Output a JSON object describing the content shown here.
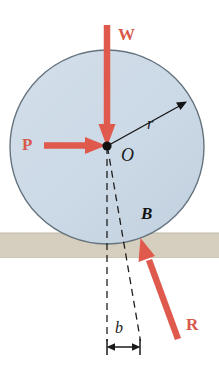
{
  "figure": {
    "canvas": {
      "width": 219,
      "height": 366
    },
    "colors": {
      "force_red": "#e0594d",
      "wheel_fill": "#ccd9e6",
      "wheel_stroke": "#5a6a76",
      "ground_fill": "#d5cfbf",
      "ground_stroke": "#bdb7a6",
      "line_black": "#1a1a1a"
    }
  },
  "wheel": {
    "name": "wheel",
    "center_label": "O",
    "radius_label": "r",
    "center_px": {
      "x": 107,
      "y": 145
    },
    "radius_px": 97
  },
  "ground": {
    "name": "ground-surface",
    "top_y_px": 233,
    "bottom_y_px": 258
  },
  "forces": [
    {
      "id": "weight",
      "label": "W",
      "direction": "down",
      "from": {
        "x": 107,
        "y": 24
      },
      "to": {
        "x": 107,
        "y": 146
      }
    },
    {
      "id": "applied",
      "label": "P",
      "direction": "right",
      "from": {
        "x": 44,
        "y": 145
      },
      "to": {
        "x": 104,
        "y": 145
      }
    },
    {
      "id": "reaction",
      "label": "R",
      "direction": "up-left",
      "from": {
        "x": 177,
        "y": 338
      },
      "to": {
        "x": 141,
        "y": 239
      }
    }
  ],
  "points": [
    {
      "id": "center",
      "label": "O"
    },
    {
      "id": "contact",
      "label": "B"
    }
  ],
  "dimensions": [
    {
      "id": "offset",
      "label": "b",
      "from_x": 107,
      "to_x": 140,
      "y": 347
    }
  ]
}
